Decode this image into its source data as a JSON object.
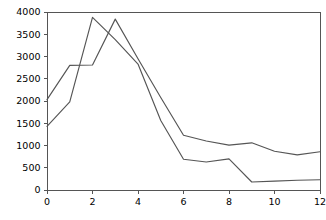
{
  "chart_data": {
    "type": "line",
    "title": "",
    "xlabel": "",
    "ylabel": "",
    "xlim": [
      0,
      12
    ],
    "ylim": [
      0,
      4000
    ],
    "grid": false,
    "legend": "none",
    "x": [
      0,
      1,
      2,
      3,
      4,
      5,
      6,
      7,
      8,
      9,
      10,
      11,
      12
    ],
    "xticks": [
      0,
      2,
      4,
      6,
      8,
      10,
      12
    ],
    "xticklabels": [
      "0",
      "2",
      "4",
      "6",
      "8",
      "10",
      "12"
    ],
    "yticks": [
      0,
      500,
      1000,
      1500,
      2000,
      2500,
      3000,
      3500,
      4000
    ],
    "yticklabels": [
      "0",
      "500",
      "1000",
      "1500",
      "2000",
      "2500",
      "3000",
      "3500",
      "4000"
    ],
    "series": [
      {
        "name": "series-1",
        "color": "#555555",
        "values": [
          2030,
          2800,
          2810,
          3840,
          2950,
          2080,
          1230,
          1100,
          1010,
          1060,
          870,
          790,
          860
        ]
      },
      {
        "name": "series-2",
        "color": "#555555",
        "values": [
          1430,
          1980,
          3880,
          3380,
          2830,
          1560,
          690,
          630,
          700,
          180,
          200,
          220,
          230
        ]
      }
    ]
  },
  "axes": {
    "x_axis_name": "x-axis",
    "y_axis_name": "y-axis"
  }
}
